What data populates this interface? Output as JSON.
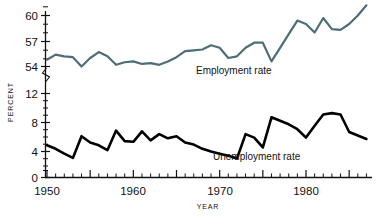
{
  "chart_data": {
    "type": "line",
    "title": "",
    "xlabel": "YEAR",
    "ylabel": "PERCENT",
    "grid": false,
    "legend_position": "inline-annotation",
    "axis_break": true,
    "axis_break_note": "y-axis broken between 54 and 12",
    "xlim": [
      1950,
      1987
    ],
    "x_tick_interval": 1,
    "x_major_tick_interval": 5,
    "x_tick_labels": [
      "1950",
      "1960",
      "1970",
      "1980"
    ],
    "x_tick_label_values": [
      1950,
      1960,
      1970,
      1980
    ],
    "y_tick_labels": [
      "60",
      "57",
      "54",
      "12",
      "8",
      "4",
      "0"
    ],
    "y_tick_label_values": [
      60,
      57,
      54,
      12,
      8,
      4,
      0
    ],
    "y_upper_range": [
      53,
      61.5
    ],
    "y_lower_range": [
      0,
      13
    ],
    "x": [
      1950,
      1951,
      1952,
      1953,
      1954,
      1955,
      1956,
      1957,
      1958,
      1959,
      1960,
      1961,
      1962,
      1963,
      1964,
      1965,
      1966,
      1967,
      1968,
      1969,
      1970,
      1971,
      1972,
      1973,
      1974,
      1975,
      1976,
      1977,
      1978,
      1979,
      1980,
      1981,
      1982,
      1983,
      1984,
      1985,
      1986,
      1987
    ],
    "series": [
      {
        "name": "Employment rate",
        "color": "#4d6e78",
        "label": "Employment rate",
        "values": [
          54.8,
          55.4,
          55.2,
          55.1,
          54.0,
          55.0,
          55.7,
          55.2,
          54.2,
          54.5,
          54.6,
          54.3,
          54.4,
          54.2,
          54.6,
          55.1,
          55.8,
          55.9,
          56.0,
          56.5,
          56.2,
          55.0,
          55.2,
          56.2,
          56.8,
          56.8,
          54.6,
          56.2,
          57.8,
          59.4,
          59.0,
          58.0,
          59.7,
          58.4,
          58.3,
          59.0,
          60.0,
          61.2
        ]
      },
      {
        "name": "Unemployment rate",
        "color": "#000000",
        "label": "Unemployment rate",
        "values": [
          4.6,
          4.1,
          3.4,
          2.8,
          5.9,
          5.0,
          4.6,
          3.9,
          6.7,
          5.2,
          5.1,
          6.6,
          5.3,
          6.2,
          5.6,
          5.9,
          5.0,
          4.7,
          4.1,
          3.7,
          3.4,
          3.1,
          2.7,
          6.2,
          5.7,
          4.3,
          8.6,
          8.1,
          7.6,
          6.9,
          5.7,
          7.4,
          9.0,
          9.2,
          9.0,
          6.5,
          6.0,
          5.5
        ]
      }
    ],
    "annotations": [
      {
        "text": "Employment rate",
        "x": 1968,
        "y": 54.6,
        "for_series": "Employment rate"
      },
      {
        "text": "Unemployment rate",
        "x": 1970.5,
        "y": 3.1,
        "for_series": "Unemployment rate"
      }
    ]
  }
}
